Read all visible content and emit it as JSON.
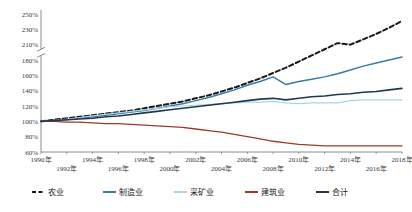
{
  "chart_data": {
    "type": "line",
    "title": "",
    "xlabel": "",
    "ylabel": "",
    "grid": false,
    "legend_position": "bottom",
    "axis_break": {
      "between": [
        180,
        210
      ],
      "note": "y-axis has a break mark between 180% and 210%"
    },
    "ylim": [
      60,
      250
    ],
    "ytick_labels": [
      "250%",
      "230%",
      "210%",
      "180%",
      "160%",
      "140%",
      "120%",
      "100%",
      "80%",
      "60%"
    ],
    "ytick_values": [
      250,
      230,
      210,
      180,
      160,
      140,
      120,
      100,
      80,
      60
    ],
    "xtick_labels_row1": [
      "1990年",
      "1994年",
      "1998年",
      "2002年",
      "2006年",
      "2010年",
      "2014年",
      "2018年"
    ],
    "xtick_labels_row2": [
      "1992年",
      "1996年",
      "2000年",
      "2004年",
      "2008年",
      "2012年",
      "2016年"
    ],
    "categories": [
      1990,
      1991,
      1992,
      1993,
      1994,
      1995,
      1996,
      1997,
      1998,
      1999,
      2000,
      2001,
      2002,
      2003,
      2004,
      2005,
      2006,
      2007,
      2008,
      2009,
      2010,
      2011,
      2012,
      2013,
      2014,
      2015,
      2016,
      2017,
      2018
    ],
    "xlim": [
      1990,
      2018
    ],
    "series": [
      {
        "name": "农业",
        "color": "#1a1a1a",
        "style": "dashed",
        "width": 2.0,
        "values": [
          100,
          102,
          104,
          106,
          108,
          110,
          112,
          114,
          117,
          120,
          123,
          126,
          130,
          134,
          139,
          144,
          150,
          156,
          163,
          170,
          178,
          186,
          194,
          202,
          210,
          217,
          224,
          232,
          241
        ]
      },
      {
        "name": "制造业",
        "color": "#3a7ca5",
        "style": "solid",
        "width": 1.5,
        "values": [
          100,
          101,
          102,
          104,
          106,
          108,
          110,
          112,
          114,
          117,
          120,
          123,
          127,
          131,
          136,
          141,
          147,
          152,
          158,
          148,
          152,
          155,
          158,
          162,
          167,
          172,
          176,
          180,
          184
        ]
      },
      {
        "name": "采矿业",
        "color": "#a8d4ea",
        "style": "solid",
        "width": 1.2,
        "values": [
          100,
          101,
          103,
          105,
          107,
          109,
          111,
          113,
          115,
          117,
          119,
          120,
          121,
          122,
          123,
          124,
          125,
          125,
          126,
          124,
          123,
          124,
          124,
          124,
          127,
          128,
          128,
          128,
          128
        ]
      },
      {
        "name": "建筑业",
        "color": "#9c3b24",
        "style": "solid",
        "width": 1.3,
        "values": [
          100,
          100,
          99,
          99,
          98,
          97,
          97,
          96,
          95,
          94,
          93,
          92,
          90,
          88,
          86,
          83,
          80,
          77,
          74,
          72,
          70,
          69,
          68,
          68,
          68,
          68,
          68,
          68,
          68
        ]
      },
      {
        "name": "合计",
        "color": "#21374f",
        "style": "solid",
        "width": 1.6,
        "values": [
          100,
          101,
          102,
          103,
          104,
          106,
          107,
          109,
          111,
          113,
          115,
          117,
          119,
          121,
          123,
          125,
          127,
          129,
          130,
          128,
          130,
          132,
          133,
          135,
          136,
          138,
          139,
          141,
          143
        ]
      }
    ]
  },
  "legend": {
    "items": [
      {
        "label": "农业",
        "color": "#1a1a1a",
        "style": "dashed"
      },
      {
        "label": "制造业",
        "color": "#3a7ca5",
        "style": "solid"
      },
      {
        "label": "采矿业",
        "color": "#a8d4ea",
        "style": "solid"
      },
      {
        "label": "建筑业",
        "color": "#9c3b24",
        "style": "solid"
      },
      {
        "label": "合计",
        "color": "#21374f",
        "style": "solid"
      }
    ]
  }
}
